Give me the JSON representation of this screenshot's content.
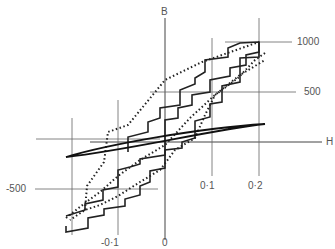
{
  "figure": {
    "top_cut_text": "...ay ... ng ... ... ...ary ... ...y ...",
    "axes": {
      "x_label": "H",
      "y_label": "B",
      "x_ticks": [
        "-0·1",
        "0",
        "0·1",
        "0·2"
      ],
      "y_ticks": [
        "1000",
        "500",
        "-500"
      ]
    },
    "curves": [
      {
        "name": "stepped-hysteresis-loop",
        "style": "solid-stepped"
      },
      {
        "name": "dotted-hysteresis-loop",
        "style": "dotted"
      },
      {
        "name": "thin-elliptical-loop",
        "style": "solid"
      }
    ]
  }
}
